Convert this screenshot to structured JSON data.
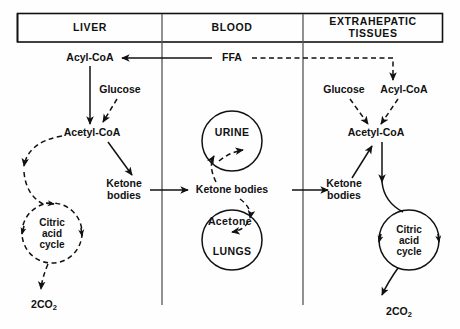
{
  "diagram": {
    "columns": [
      {
        "id": "liver",
        "label": "LIVER"
      },
      {
        "id": "blood",
        "label": "BLOOD"
      },
      {
        "id": "extrahepatic",
        "label_line1": "EXTRAHEPATIC",
        "label_line2": "TISSUES"
      }
    ],
    "liver": {
      "acyl_coa": "Acyl-CoA",
      "glucose": "Glucose",
      "acetyl_coa": "Acetyl-CoA",
      "ketone_bodies_line1": "Ketone",
      "ketone_bodies_line2": "bodies",
      "cycle_line1": "Citric",
      "cycle_line2": "acid",
      "cycle_line3": "cycle",
      "co2_value": "2CO",
      "co2_subscript": "2"
    },
    "blood": {
      "ffa": "FFA",
      "urine": "URINE",
      "ketone_bodies": "Ketone bodies",
      "acetone": "Acetone",
      "lungs": "LUNGS"
    },
    "extrahepatic": {
      "glucose": "Glucose",
      "acyl_coa": "Acyl-CoA",
      "acetyl_coa": "Acetyl-CoA",
      "ketone_bodies_line1": "Ketone",
      "ketone_bodies_line2": "bodies",
      "cycle_line1": "Citric",
      "cycle_line2": "acid",
      "cycle_line3": "cycle",
      "co2_value": "2CO",
      "co2_subscript": "2"
    },
    "colors": {
      "ink": "#111111",
      "divider": "#555555",
      "background": "#fefefe"
    }
  }
}
